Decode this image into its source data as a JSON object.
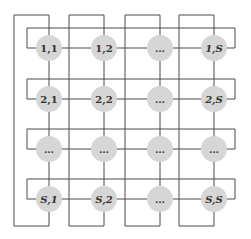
{
  "diagram": {
    "type": "torus-grid",
    "rows": 4,
    "cols": 4,
    "colors": {
      "node_fill": "#d6d6d6",
      "wire": "#4a4a4a",
      "label": "#333333",
      "background": "#ffffff"
    },
    "nodes": [
      [
        {
          "label": "1,1"
        },
        {
          "label": "1,2"
        },
        {
          "label": "…"
        },
        {
          "label": "1,S"
        }
      ],
      [
        {
          "label": "2,1"
        },
        {
          "label": "2,2"
        },
        {
          "label": "…"
        },
        {
          "label": "2,S"
        }
      ],
      [
        {
          "label": "…"
        },
        {
          "label": "…"
        },
        {
          "label": "…"
        },
        {
          "label": "…"
        }
      ],
      [
        {
          "label": "S,1"
        },
        {
          "label": "S,2"
        },
        {
          "label": "…"
        },
        {
          "label": "S,S"
        }
      ]
    ]
  }
}
